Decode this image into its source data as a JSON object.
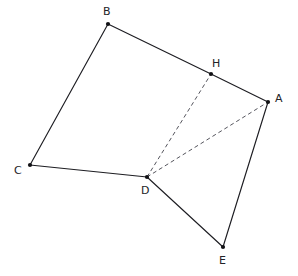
{
  "figure": {
    "background_color": "#ffffff",
    "solid_stroke_color": "#1d1d22",
    "dashed_stroke_color": "#55555d",
    "vertex_color": "#111115",
    "label_color": "#232327",
    "width": 298,
    "height": 276
  },
  "points": [
    {
      "id": "A",
      "label": "A",
      "x": 268,
      "y": 102,
      "label_x": 275,
      "label_y": 93
    },
    {
      "id": "B",
      "label": "B",
      "x": 108,
      "y": 24,
      "label_x": 103,
      "label_y": 6
    },
    {
      "id": "C",
      "label": "C",
      "x": 30,
      "y": 165,
      "label_x": 14,
      "label_y": 165
    },
    {
      "id": "D",
      "label": "D",
      "x": 147,
      "y": 177,
      "label_x": 141,
      "label_y": 185
    },
    {
      "id": "E",
      "label": "E",
      "x": 223,
      "y": 247,
      "label_x": 219,
      "label_y": 255
    },
    {
      "id": "H",
      "label": "H",
      "x": 211,
      "y": 74,
      "label_x": 212,
      "label_y": 58
    }
  ],
  "edges": [
    {
      "id": "B-C",
      "from": "B",
      "to": "C",
      "style": "solid",
      "x1": 108,
      "y1": 24,
      "x2": 30,
      "y2": 165
    },
    {
      "id": "C-D",
      "from": "C",
      "to": "D",
      "style": "solid",
      "x1": 30,
      "y1": 165,
      "x2": 147,
      "y2": 177
    },
    {
      "id": "B-H",
      "from": "B",
      "to": "H",
      "style": "solid",
      "x1": 108,
      "y1": 24,
      "x2": 211,
      "y2": 74
    },
    {
      "id": "H-A",
      "from": "H",
      "to": "A",
      "style": "solid",
      "x1": 211,
      "y1": 74,
      "x2": 268,
      "y2": 102
    },
    {
      "id": "A-E",
      "from": "A",
      "to": "E",
      "style": "solid",
      "x1": 268,
      "y1": 102,
      "x2": 223,
      "y2": 247
    },
    {
      "id": "E-D",
      "from": "E",
      "to": "D",
      "style": "solid",
      "x1": 223,
      "y1": 247,
      "x2": 147,
      "y2": 177
    },
    {
      "id": "D-H",
      "from": "D",
      "to": "H",
      "style": "dashed",
      "x1": 147,
      "y1": 177,
      "x2": 211,
      "y2": 74
    },
    {
      "id": "D-A",
      "from": "D",
      "to": "A",
      "style": "dashed",
      "x1": 147,
      "y1": 177,
      "x2": 268,
      "y2": 102
    }
  ],
  "vertex_dot_radius": 2.1
}
